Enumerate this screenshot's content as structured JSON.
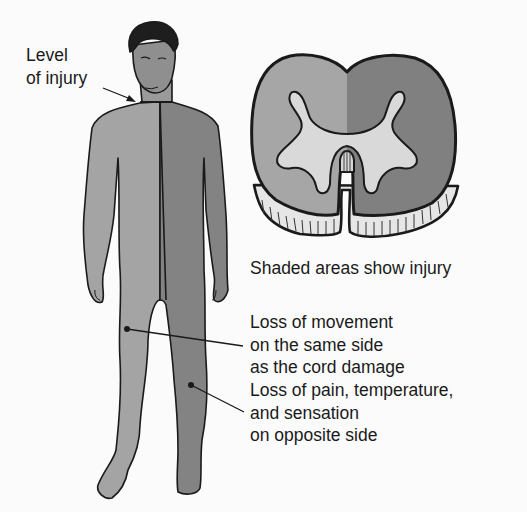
{
  "labels": {
    "level_of_injury": [
      "Level",
      "of injury"
    ],
    "caption": "Shaded areas show injury",
    "same_side": [
      "Loss of movement",
      "on the same side",
      "as the cord damage"
    ],
    "opposite_side": [
      "Loss of pain, temperature,",
      "and sensation",
      "on opposite side"
    ]
  },
  "colors": {
    "left_side_shade": "#9d9d9d",
    "right_side_shade": "#7d7d7d",
    "gray_matter": "#d9d9d9",
    "outline": "#1a1a1a",
    "hair": "#1e1e1e",
    "background": "#fbfbfb"
  }
}
